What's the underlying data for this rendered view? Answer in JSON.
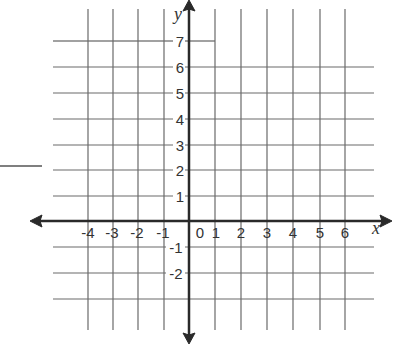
{
  "figure": {
    "type": "coordinate-plane",
    "x_axis": {
      "label": "x",
      "ticks": [
        "-4",
        "-3",
        "-2",
        "-1",
        "0",
        "1",
        "2",
        "3",
        "4",
        "5",
        "6"
      ],
      "range": [
        -4,
        6
      ]
    },
    "y_axis": {
      "label": "y",
      "ticks": [
        "7",
        "6",
        "5",
        "4",
        "3",
        "2",
        "1",
        "-1",
        "-2"
      ],
      "range": [
        -3,
        7
      ]
    },
    "colors": {
      "grid": "#6a6a6a",
      "axis": "#2a2a2a",
      "labels": "#333333",
      "background": "#ffffff"
    }
  }
}
